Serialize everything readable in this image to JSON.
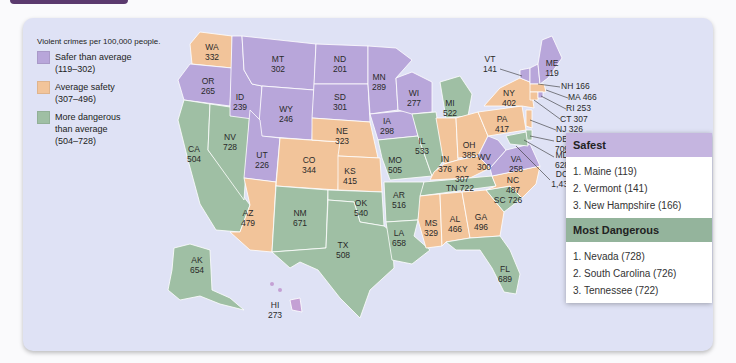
{
  "legend": {
    "title": "Violent crimes per 100,000 people.",
    "items": [
      {
        "label": "Safer than average\n(119–302)",
        "color": "#b8a6da"
      },
      {
        "label": "Average safety\n(307–496)",
        "color": "#f2c49a"
      },
      {
        "label": "More dangerous\nthan average\n(504–728)",
        "color": "#9fbfa4"
      }
    ]
  },
  "colors": {
    "safe": "#b8a6da",
    "average": "#f2c49a",
    "danger": "#9fbfa4",
    "safest_header": "#c5b5e0",
    "dangerous_header": "#94b49c",
    "panel": "#dfe2f5",
    "top_tab": "#5b3a6e"
  },
  "states": [
    {
      "abbr": "WA",
      "value": "332",
      "category": "average"
    },
    {
      "abbr": "OR",
      "value": "265",
      "category": "safe"
    },
    {
      "abbr": "CA",
      "value": "504",
      "category": "danger"
    },
    {
      "abbr": "ID",
      "value": "239",
      "category": "safe"
    },
    {
      "abbr": "NV",
      "value": "728",
      "category": "danger"
    },
    {
      "abbr": "MT",
      "value": "302",
      "category": "safe"
    },
    {
      "abbr": "WY",
      "value": "246",
      "category": "safe"
    },
    {
      "abbr": "UT",
      "value": "226",
      "category": "safe"
    },
    {
      "abbr": "AZ",
      "value": "479",
      "category": "average"
    },
    {
      "abbr": "CO",
      "value": "344",
      "category": "average"
    },
    {
      "abbr": "NM",
      "value": "671",
      "category": "danger"
    },
    {
      "abbr": "ND",
      "value": "201",
      "category": "safe"
    },
    {
      "abbr": "SD",
      "value": "301",
      "category": "safe"
    },
    {
      "abbr": "NE",
      "value": "323",
      "category": "average"
    },
    {
      "abbr": "KS",
      "value": "415",
      "category": "average"
    },
    {
      "abbr": "OK",
      "value": "540",
      "category": "danger"
    },
    {
      "abbr": "TX",
      "value": "508",
      "category": "danger"
    },
    {
      "abbr": "MN",
      "value": "289",
      "category": "safe"
    },
    {
      "abbr": "IA",
      "value": "298",
      "category": "safe"
    },
    {
      "abbr": "MO",
      "value": "505",
      "category": "danger"
    },
    {
      "abbr": "AR",
      "value": "516",
      "category": "danger"
    },
    {
      "abbr": "LA",
      "value": "658",
      "category": "danger"
    },
    {
      "abbr": "WI",
      "value": "277",
      "category": "safe"
    },
    {
      "abbr": "IL",
      "value": "533",
      "category": "danger"
    },
    {
      "abbr": "MI",
      "value": "522",
      "category": "danger"
    },
    {
      "abbr": "IN",
      "value": "376",
      "category": "average"
    },
    {
      "abbr": "OH",
      "value": "385",
      "category": "average"
    },
    {
      "abbr": "KY",
      "value": "307",
      "category": "average"
    },
    {
      "abbr": "TN",
      "value": "722",
      "category": "danger"
    },
    {
      "abbr": "MS",
      "value": "329",
      "category": "average"
    },
    {
      "abbr": "AL",
      "value": "466",
      "category": "average"
    },
    {
      "abbr": "GA",
      "value": "496",
      "category": "average"
    },
    {
      "abbr": "FL",
      "value": "689",
      "category": "danger"
    },
    {
      "abbr": "SC",
      "value": "726",
      "category": "danger"
    },
    {
      "abbr": "NC",
      "value": "487",
      "category": "average"
    },
    {
      "abbr": "VA",
      "value": "258",
      "category": "safe"
    },
    {
      "abbr": "WV",
      "value": "300",
      "category": "safe"
    },
    {
      "abbr": "PA",
      "value": "417",
      "category": "average"
    },
    {
      "abbr": "NY",
      "value": "402",
      "category": "average"
    },
    {
      "abbr": "VT",
      "value": "141",
      "category": "safe"
    },
    {
      "abbr": "ME",
      "value": "119",
      "category": "safe"
    },
    {
      "abbr": "NH",
      "value": "166",
      "category": "safe"
    },
    {
      "abbr": "MA",
      "value": "466",
      "category": "average"
    },
    {
      "abbr": "RI",
      "value": "253",
      "category": "safe"
    },
    {
      "abbr": "CT",
      "value": "307",
      "category": "average"
    },
    {
      "abbr": "NJ",
      "value": "326",
      "category": "average"
    },
    {
      "abbr": "DE",
      "value": "709",
      "category": "danger"
    },
    {
      "abbr": "MD",
      "value": "628",
      "category": "danger"
    },
    {
      "abbr": "DC",
      "value": "1,438",
      "category": "danger"
    },
    {
      "abbr": "AK",
      "value": "654",
      "category": "danger"
    },
    {
      "abbr": "HI",
      "value": "273",
      "category": "safe"
    }
  ],
  "rankings": {
    "safest": {
      "title": "Safest",
      "items": [
        "1. Maine (119)",
        "2. Vermont (141)",
        "3. New Hampshire (166)"
      ]
    },
    "most_dangerous": {
      "title": "Most Dangerous",
      "items": [
        "1. Nevada (728)",
        "2. South Carolina (726)",
        "3. Tennessee (722)"
      ]
    }
  }
}
